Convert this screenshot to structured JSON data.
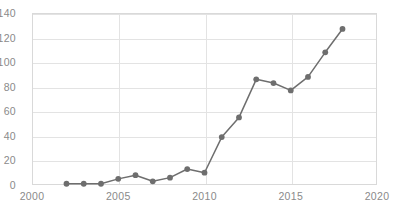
{
  "chart_data": {
    "type": "line",
    "title": "",
    "subtitle": "",
    "xlabel": "",
    "ylabel": "",
    "x": [
      2002,
      2003,
      2004,
      2005,
      2006,
      2007,
      2008,
      2009,
      2010,
      2011,
      2012,
      2013,
      2014,
      2015,
      2016,
      2017,
      2018
    ],
    "values": [
      1,
      1,
      1,
      5,
      8,
      3,
      6,
      13,
      10,
      39,
      55,
      86,
      83,
      77,
      88,
      108,
      127
    ],
    "series": [
      {
        "name": "",
        "values": [
          1,
          1,
          1,
          5,
          8,
          3,
          6,
          13,
          10,
          39,
          55,
          86,
          83,
          77,
          88,
          108,
          127
        ]
      }
    ],
    "xlim": [
      2000,
      2020
    ],
    "ylim": [
      0,
      140
    ],
    "xticks": [
      2000,
      2005,
      2010,
      2015,
      2020
    ],
    "yticks": [
      0,
      20,
      40,
      60,
      80,
      100,
      120,
      140
    ],
    "xtick_labels": [
      "2000",
      "2005",
      "2010",
      "2015",
      "2020"
    ],
    "ytick_labels": [
      "0",
      "20",
      "40",
      "60",
      "80",
      "100",
      "120",
      "140"
    ],
    "grid": true,
    "grid_axis": "both",
    "legend": false,
    "legend_position": "none",
    "marker": "circle",
    "annotations": [],
    "colors": {
      "line": "#6e6e6e",
      "marker": "#6e6e6e",
      "grid": "#e3e3e3",
      "frame": "#d9d9d9",
      "tick_label": "#8a8a8a",
      "background": "#ffffff"
    }
  }
}
